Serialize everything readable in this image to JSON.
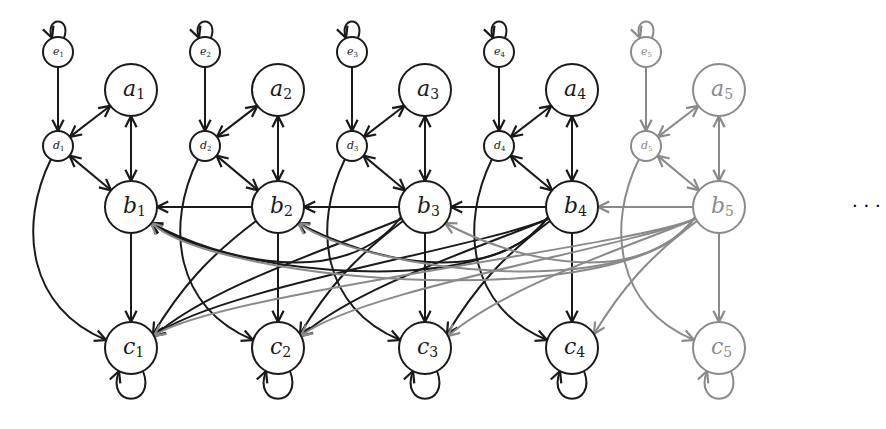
{
  "diagram": {
    "colors": {
      "active": "#1a1a1a",
      "faded": "#8a8a8a",
      "background": "#ffffff"
    },
    "column_count": 5,
    "faded_columns": [
      5
    ],
    "ellipsis": "· · ·",
    "columns": [
      {
        "index": 1,
        "a": "a",
        "b": "b",
        "c": "c",
        "d": "d",
        "e": "e",
        "sub": "1"
      },
      {
        "index": 2,
        "a": "a",
        "b": "b",
        "c": "c",
        "d": "d",
        "e": "e",
        "sub": "2"
      },
      {
        "index": 3,
        "a": "a",
        "b": "b",
        "c": "c",
        "d": "d",
        "e": "e",
        "sub": "3"
      },
      {
        "index": 4,
        "a": "a",
        "b": "b",
        "c": "c",
        "d": "d",
        "e": "e",
        "sub": "4"
      },
      {
        "index": 5,
        "a": "a",
        "b": "b",
        "c": "c",
        "d": "d",
        "e": "e",
        "sub": "5"
      }
    ],
    "edges_per_column": [
      "e_k -> e_k (self-loop)",
      "e_k -> d_k",
      "d_k <-> a_k",
      "d_k <-> b_k",
      "a_k <-> b_k",
      "b_k -> c_k",
      "d_k -> c_k (curved)",
      "c_k -> c_k (self-loop)",
      "b_k -> b_j for all j < k",
      "b_k -> c_j for all j < k"
    ]
  }
}
